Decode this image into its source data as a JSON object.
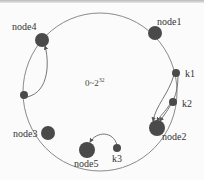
{
  "diagram": {
    "ring_label": {
      "base": "0~2",
      "exponent": "32"
    },
    "colors": {
      "ring": "#8a8a8a",
      "node": "#4a4a4a",
      "arrow": "#666666",
      "text": "#333333"
    },
    "nodes": [
      {
        "id": "node1",
        "label": "node1",
        "kind": "server"
      },
      {
        "id": "node2",
        "label": "node2",
        "kind": "server"
      },
      {
        "id": "node3",
        "label": "node3",
        "kind": "server"
      },
      {
        "id": "node4",
        "label": "node4",
        "kind": "server"
      },
      {
        "id": "node5",
        "label": "node5",
        "kind": "server"
      },
      {
        "id": "k1",
        "label": "k1",
        "kind": "key"
      },
      {
        "id": "k2",
        "label": "k2",
        "kind": "key"
      },
      {
        "id": "k3",
        "label": "k3",
        "kind": "key"
      },
      {
        "id": "unlabeled-key",
        "label": "",
        "kind": "key"
      }
    ],
    "edges": [
      {
        "from": "k1",
        "to": "node2"
      },
      {
        "from": "k2",
        "to": "node2"
      },
      {
        "from": "k3",
        "to": "node5"
      },
      {
        "from": "unlabeled-key",
        "to": "node4"
      }
    ]
  }
}
